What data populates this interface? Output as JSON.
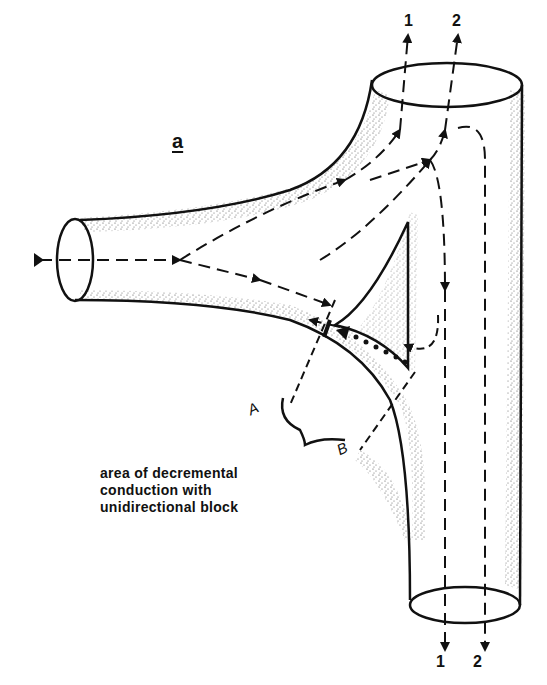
{
  "figure": {
    "panel_label": "a",
    "top_labels": [
      "1",
      "2"
    ],
    "bottom_labels": [
      "1",
      "2"
    ],
    "point_labels": {
      "a": "A",
      "b": "B"
    },
    "caption_lines": [
      "area of decremental",
      "conduction with",
      "unidirectional block"
    ],
    "colors": {
      "ink": "#111111",
      "background": "#ffffff",
      "stipple": "#333333"
    }
  }
}
